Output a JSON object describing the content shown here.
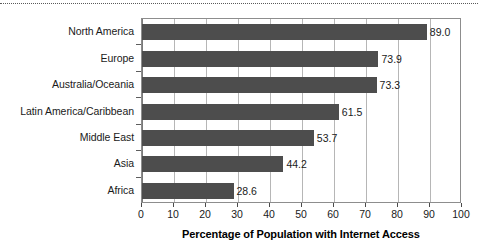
{
  "chart_data": {
    "type": "bar",
    "orientation": "horizontal",
    "title": "",
    "xlabel": "Percentage of Population with Internet Access",
    "ylabel": "",
    "xlim": [
      0,
      100
    ],
    "xticks": [
      0,
      10,
      20,
      30,
      40,
      50,
      60,
      70,
      80,
      90,
      100
    ],
    "xtick_labels": [
      "0",
      "10",
      "20",
      "30",
      "40",
      "50",
      "60",
      "70",
      "80",
      "90",
      "100"
    ],
    "grid": "vertical",
    "legend": "none",
    "bar_color": "#4d4d4d",
    "categories": [
      "North America",
      "Europe",
      "Australia/Oceania",
      "Latin America/Caribbean",
      "Middle East",
      "Asia",
      "Africa"
    ],
    "values": [
      89.0,
      73.9,
      73.3,
      61.5,
      53.7,
      44.2,
      28.6
    ],
    "value_labels": [
      "89.0",
      "73.9",
      "73.3",
      "61.5",
      "53.7",
      "44.2",
      "28.6"
    ]
  },
  "decor": {
    "top_rule": "dotted-separator"
  }
}
